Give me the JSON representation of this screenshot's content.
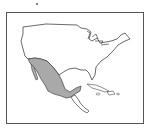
{
  "map": {
    "title": "North America - Mexico highlighted",
    "highlighted_region": "Mexico",
    "colors": {
      "highlight": "#a9a9a9",
      "outline": "#444444",
      "background": "#ffffff",
      "frame": "#555555"
    }
  }
}
